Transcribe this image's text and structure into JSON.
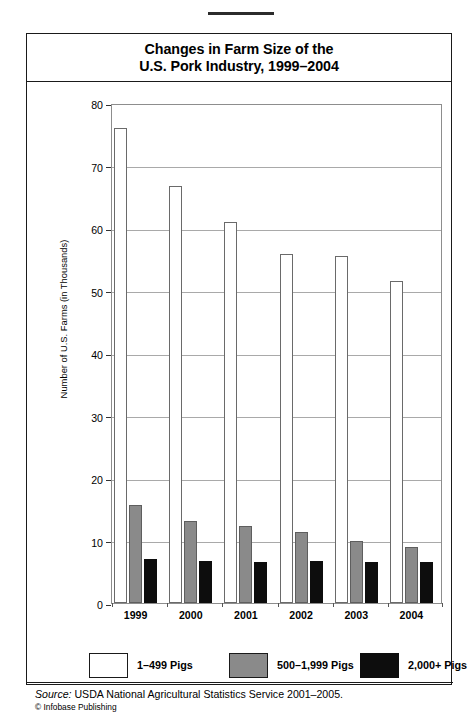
{
  "title": {
    "line1": "Changes in Farm Size of the",
    "line2": "U.S. Pork Industry, 1999–2004"
  },
  "source": {
    "label": "Source:",
    "text": " USDA National Agricultural Statistics Service 2001–2005.",
    "credit": "© Infobase Publishing"
  },
  "colors": {
    "series_small": "#ffffff",
    "series_medium": "#8a8a8a",
    "series_large": "#0d0d0d",
    "frame": "#1a1a1a",
    "gridline": "#a9a9a9"
  },
  "chart_data": {
    "type": "bar",
    "title": "Changes in Farm Size of the U.S. Pork Industry, 1999–2004",
    "xlabel": "",
    "ylabel": "Number of U.S. Farms (in Thousands)",
    "ylim": [
      0,
      80
    ],
    "yticks": [
      0,
      10,
      20,
      30,
      40,
      50,
      60,
      70,
      80
    ],
    "ytick_labels": [
      "0",
      "10",
      "20",
      "30",
      "40",
      "50",
      "60",
      "70",
      "80"
    ],
    "grid": true,
    "grid_axis": "y",
    "legend_position": "bottom",
    "categories": [
      "1999",
      "2000",
      "2001",
      "2002",
      "2003",
      "2004"
    ],
    "series": [
      {
        "name": "1–499 Pigs",
        "color": "#ffffff",
        "values": [
          76.0,
          66.7,
          61.0,
          55.8,
          55.5,
          51.5
        ]
      },
      {
        "name": "500–1,999 Pigs",
        "color": "#8a8a8a",
        "values": [
          15.7,
          13.2,
          12.3,
          11.4,
          10.0,
          8.9
        ]
      },
      {
        "name": "2,000+ Pigs",
        "color": "#0d0d0d",
        "values": [
          7.0,
          6.7,
          6.6,
          6.7,
          6.5,
          6.6
        ]
      }
    ]
  }
}
